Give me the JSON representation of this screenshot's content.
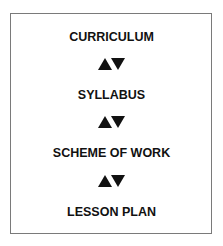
{
  "diagram": {
    "type": "vertical-hierarchy",
    "levels": [
      {
        "label": "CURRICULUM"
      },
      {
        "label": "SYLLABUS"
      },
      {
        "label": "SCHEME OF WORK"
      },
      {
        "label": "LESSON PLAN"
      }
    ],
    "connectors": [
      {
        "from": "CURRICULUM",
        "to": "SYLLABUS",
        "icon": "up-down-triangles-icon"
      },
      {
        "from": "SYLLABUS",
        "to": "SCHEME OF WORK",
        "icon": "up-down-triangles-icon"
      },
      {
        "from": "SCHEME OF WORK",
        "to": "LESSON PLAN",
        "icon": "up-down-triangles-icon"
      }
    ],
    "colors": {
      "text": "#111111",
      "border": "#7a7a7a",
      "background": "#ffffff"
    }
  }
}
